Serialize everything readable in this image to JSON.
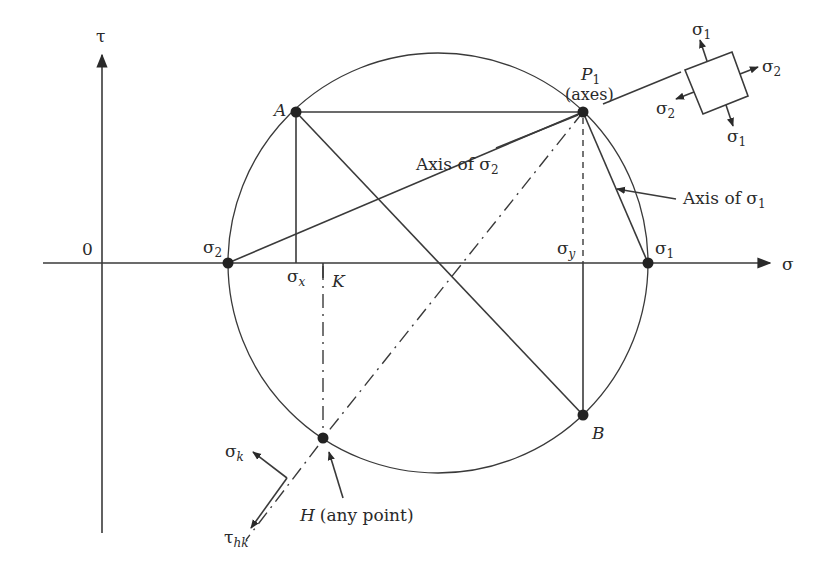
{
  "diagram": {
    "axes": {
      "horizontal_label": "σ",
      "vertical_label": "τ",
      "origin_label": "0"
    },
    "points": {
      "A": "A",
      "B": "B",
      "P1": "P",
      "P1_sub": "1",
      "P1_note": "(axes)",
      "H": "H",
      "H_note": "(any point)",
      "sigma1": "σ",
      "sigma1_sub": "1",
      "sigma2": "σ",
      "sigma2_sub": "2",
      "sigma_x": "σ",
      "sigma_x_sub": "x",
      "sigma_y": "σ",
      "sigma_y_sub": "y",
      "K": "K"
    },
    "annotations": {
      "axis_sigma2": "Axis of σ",
      "axis_sigma2_sub": "2",
      "axis_sigma1": "Axis of σ",
      "axis_sigma1_sub": "1"
    },
    "element_inset": {
      "top": "σ",
      "top_sub": "1",
      "right": "σ",
      "right_sub": "2",
      "left": "σ",
      "left_sub": "2",
      "bottom": "σ",
      "bottom_sub": "1"
    },
    "plane_inset": {
      "normal": "σ",
      "normal_sub": "k",
      "shear": "τ",
      "shear_sub": "hk"
    }
  }
}
